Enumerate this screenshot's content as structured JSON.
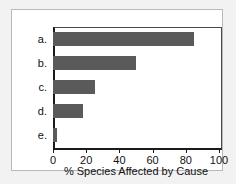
{
  "chart_data": {
    "type": "bar",
    "orientation": "horizontal",
    "title": "",
    "xlabel": "% Species Affected by Cause",
    "ylabel": "",
    "categories": [
      "a.",
      "b.",
      "c.",
      "d.",
      "e."
    ],
    "values": [
      85,
      50,
      25,
      18,
      2.5
    ],
    "xlim": [
      0,
      100
    ],
    "xticks": [
      0,
      20,
      40,
      60,
      80,
      100
    ],
    "xtick_labels": [
      "0",
      "20",
      "40",
      "60",
      "80",
      "100"
    ],
    "grid": false,
    "legend": null,
    "bar_color": "#5a5a5a",
    "axis_color": "#1a1a1a",
    "plot_background": "#ffffff",
    "figure_background": "#f2f2f2"
  }
}
